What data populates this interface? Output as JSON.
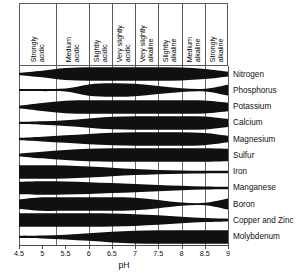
{
  "chart_data": {
    "type": "area",
    "title": "",
    "xlabel": "pH",
    "ylabel": "",
    "xlim": [
      4.5,
      9.0
    ],
    "xticks": [
      "4.5",
      "5",
      "5.5",
      "6",
      "6.5",
      "7",
      "7.5",
      "8",
      "8.5",
      "9"
    ],
    "xtick_values": [
      4.5,
      5.0,
      5.5,
      6.0,
      6.5,
      7.0,
      7.5,
      8.0,
      8.5,
      9.0
    ],
    "grid": true,
    "legend": "none",
    "ph_class_bands": [
      {
        "label_line1": "Strongly",
        "label_line2": "acidic",
        "from": 4.5,
        "to": 5.3
      },
      {
        "label_line1": "Medium",
        "label_line2": "acidic",
        "from": 5.3,
        "to": 6.0
      },
      {
        "label_line1": "Slightly",
        "label_line2": "acidic",
        "from": 6.0,
        "to": 6.5
      },
      {
        "label_line1": "Very slightly",
        "label_line2": "acidic",
        "from": 6.5,
        "to": 7.0
      },
      {
        "label_line1": "Very slightly",
        "label_line2": "alkaline",
        "from": 7.0,
        "to": 7.5
      },
      {
        "label_line1": "Slightly",
        "label_line2": "alkaline",
        "from": 7.5,
        "to": 8.0
      },
      {
        "label_line1": "Medium",
        "label_line2": "alkaline",
        "from": 8.0,
        "to": 8.5
      },
      {
        "label_line1": "Strongly",
        "label_line2": "alkaline",
        "from": 8.5,
        "to": 9.0
      }
    ],
    "series": [
      {
        "name": "Nitrogen",
        "x": [
          4.5,
          5.0,
          5.5,
          6.0,
          6.5,
          7.0,
          7.5,
          8.0,
          8.5,
          9.0
        ],
        "width": [
          0.12,
          0.45,
          0.88,
          1.0,
          1.0,
          1.0,
          1.0,
          0.95,
          0.72,
          0.3
        ]
      },
      {
        "name": "Phosphorus",
        "x": [
          4.5,
          5.0,
          5.5,
          6.0,
          6.5,
          7.0,
          7.5,
          8.0,
          8.5,
          9.0
        ],
        "width": [
          0.1,
          0.1,
          0.16,
          0.82,
          1.0,
          0.92,
          0.55,
          0.22,
          0.14,
          0.78
        ]
      },
      {
        "name": "Potassium",
        "x": [
          4.5,
          5.0,
          5.5,
          6.0,
          6.5,
          7.0,
          7.5,
          8.0,
          8.5,
          9.0
        ],
        "width": [
          0.12,
          0.55,
          0.92,
          1.0,
          1.0,
          1.0,
          1.0,
          1.0,
          0.95,
          0.6
        ]
      },
      {
        "name": "Calcium",
        "x": [
          4.5,
          5.0,
          5.5,
          6.0,
          6.5,
          7.0,
          7.5,
          8.0,
          8.5,
          9.0
        ],
        "width": [
          0.1,
          0.2,
          0.38,
          0.66,
          0.92,
          1.0,
          1.0,
          1.0,
          0.95,
          0.55
        ]
      },
      {
        "name": "Magnesium",
        "x": [
          4.5,
          5.0,
          5.5,
          6.0,
          6.5,
          7.0,
          7.5,
          8.0,
          8.5,
          9.0
        ],
        "width": [
          0.12,
          0.3,
          0.52,
          0.74,
          0.92,
          1.0,
          1.0,
          1.0,
          0.9,
          0.45
        ]
      },
      {
        "name": "Sulfur",
        "x": [
          4.5,
          5.0,
          5.5,
          6.0,
          6.5,
          7.0,
          7.5,
          8.0,
          8.5,
          9.0
        ],
        "width": [
          0.14,
          0.45,
          0.72,
          0.92,
          1.0,
          1.0,
          1.0,
          1.0,
          1.0,
          0.92
        ]
      },
      {
        "name": "Iron",
        "x": [
          4.5,
          5.0,
          5.5,
          6.0,
          6.5,
          7.0,
          7.5,
          8.0,
          8.5,
          9.0
        ],
        "width": [
          1.0,
          1.0,
          0.95,
          0.8,
          0.6,
          0.4,
          0.26,
          0.18,
          0.14,
          0.12
        ]
      },
      {
        "name": "Manganese",
        "x": [
          4.5,
          5.0,
          5.5,
          6.0,
          6.5,
          7.0,
          7.5,
          8.0,
          8.5,
          9.0
        ],
        "width": [
          0.92,
          1.0,
          0.96,
          0.86,
          0.72,
          0.58,
          0.42,
          0.28,
          0.16,
          0.12
        ]
      },
      {
        "name": "Boron",
        "x": [
          4.5,
          5.0,
          5.5,
          6.0,
          6.5,
          7.0,
          7.5,
          8.0,
          8.5,
          9.0
        ],
        "width": [
          0.66,
          1.0,
          1.0,
          1.0,
          1.0,
          0.92,
          0.58,
          0.18,
          0.12,
          0.8
        ]
      },
      {
        "name": "Copper and Zinc",
        "x": [
          4.5,
          5.0,
          5.5,
          6.0,
          6.5,
          7.0,
          7.5,
          8.0,
          8.5,
          9.0
        ],
        "width": [
          1.0,
          1.0,
          1.0,
          1.0,
          0.96,
          0.86,
          0.68,
          0.44,
          0.24,
          0.14
        ]
      },
      {
        "name": "Molybdenum",
        "x": [
          4.5,
          5.0,
          5.5,
          6.0,
          6.5,
          7.0,
          7.5,
          8.0,
          8.5,
          9.0
        ],
        "width": [
          0.1,
          0.16,
          0.3,
          0.52,
          0.78,
          0.94,
          1.0,
          1.0,
          1.0,
          1.0
        ]
      }
    ]
  },
  "colors": {
    "band": "#101010",
    "grid": "#6a6a6a",
    "axis": "#4a4a4a",
    "text": "#111111",
    "background": "#ffffff"
  }
}
